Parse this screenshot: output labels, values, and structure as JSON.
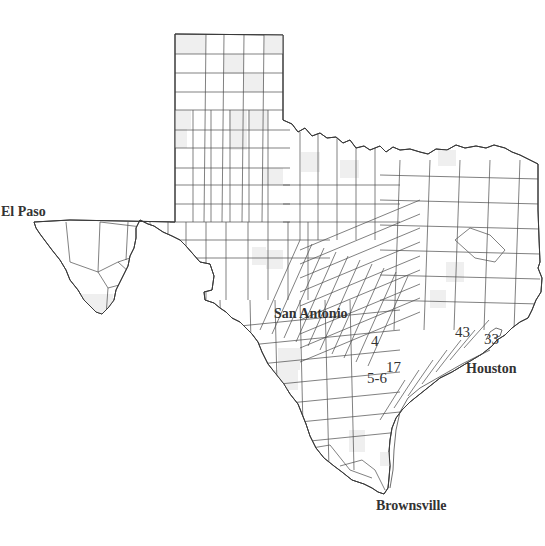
{
  "map": {
    "title": "Texas counties",
    "cities": [
      {
        "id": "el-paso",
        "label": "El Paso"
      },
      {
        "id": "san-antonio",
        "label": "San Antonio"
      },
      {
        "id": "houston",
        "label": "Houston"
      },
      {
        "id": "brownsville",
        "label": "Brownsville"
      }
    ],
    "site_markers": [
      {
        "id": "site-4",
        "label": "4"
      },
      {
        "id": "site-17",
        "label": "17"
      },
      {
        "id": "site-5-6",
        "label": "5-6"
      },
      {
        "id": "site-43",
        "label": "43"
      },
      {
        "id": "site-33",
        "label": "33"
      }
    ],
    "colors": {
      "border": "#3a3a3a",
      "county_line": "#4a4a4a",
      "shaded_county": "#efefef",
      "label": "#333333",
      "background": "#ffffff"
    }
  }
}
